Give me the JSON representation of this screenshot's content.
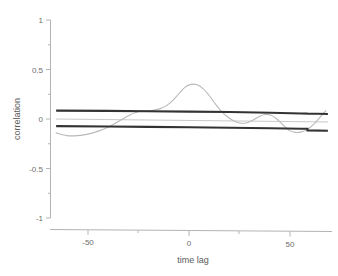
{
  "chart_data": {
    "type": "line",
    "title": "",
    "subtitle": "",
    "xlabel": "time lag",
    "ylabel": "correlation",
    "xlim": [
      -68,
      70
    ],
    "ylim": [
      -1,
      1
    ],
    "grid": false,
    "legend": "none",
    "x_ticks": [
      -50,
      0,
      50
    ],
    "x_tick_labels": [
      "-50",
      "0",
      "50"
    ],
    "x_minor_ticks": [
      -25,
      25
    ],
    "y_ticks": [
      -1,
      -0.5,
      0,
      0.5,
      1
    ],
    "y_tick_labels": [
      "-1",
      "-0.5",
      "0",
      "0.5",
      "1"
    ],
    "y_minor_ticks": [
      -0.75,
      -0.25,
      0.25,
      0.75
    ],
    "series": [
      {
        "name": "cross-correlation",
        "role": "data",
        "color": "#b9b9b9",
        "x": [
          -65,
          -62,
          -59,
          -56,
          -53,
          -50,
          -47,
          -44,
          -41,
          -38,
          -35,
          -32,
          -29,
          -26,
          -23,
          -20,
          -17,
          -14,
          -11,
          -8,
          -5,
          -2,
          1,
          4,
          7,
          10,
          13,
          16,
          19,
          22,
          25,
          28,
          31,
          34,
          37,
          40,
          43,
          46,
          49,
          52,
          55,
          58,
          61,
          64,
          67
        ],
        "y": [
          -0.14,
          -0.16,
          -0.17,
          -0.17,
          -0.165,
          -0.155,
          -0.14,
          -0.12,
          -0.095,
          -0.065,
          -0.03,
          0.005,
          0.04,
          0.065,
          0.08,
          0.085,
          0.09,
          0.105,
          0.135,
          0.185,
          0.255,
          0.32,
          0.35,
          0.345,
          0.305,
          0.235,
          0.15,
          0.075,
          0.02,
          -0.02,
          -0.04,
          -0.04,
          -0.015,
          0.02,
          0.045,
          0.04,
          0.0,
          -0.06,
          -0.115,
          -0.135,
          -0.13,
          -0.105,
          -0.055,
          0.015,
          0.085
        ]
      },
      {
        "name": "upper confidence bound",
        "role": "confidence",
        "color": "#333333",
        "x": [
          -65,
          -40,
          -20,
          0,
          20,
          40,
          55,
          58,
          58,
          68
        ],
        "y": [
          0.085,
          0.082,
          0.079,
          0.075,
          0.07,
          0.063,
          0.056,
          0.054,
          0.055,
          0.051
        ]
      },
      {
        "name": "lower confidence bound",
        "role": "confidence",
        "color": "#333333",
        "x": [
          -65,
          -40,
          -20,
          0,
          20,
          40,
          55,
          58,
          58,
          68
        ],
        "y": [
          -0.072,
          -0.076,
          -0.08,
          -0.084,
          -0.089,
          -0.094,
          -0.098,
          -0.099,
          -0.115,
          -0.118
        ]
      },
      {
        "name": "zero reference",
        "role": "reference",
        "color": "#c9c9c9",
        "x": [
          -65,
          68
        ],
        "y": [
          0.0,
          -0.03
        ]
      }
    ]
  },
  "axes": {
    "x_title": "time lag",
    "y_title": "correlation"
  }
}
